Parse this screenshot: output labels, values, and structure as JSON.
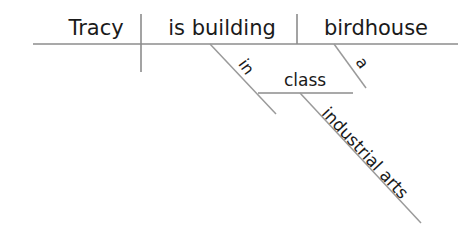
{
  "diagram": {
    "type": "reed-kellogg-sentence-diagram",
    "sentence": "Tracy is building a birdhouse in industrial arts class.",
    "line_color": "#8c8c8c",
    "text_color": "#1a1a1a",
    "background_color": "#ffffff",
    "words": {
      "subject": "Tracy",
      "verb": "is building",
      "direct_object": "birdhouse",
      "article": "a",
      "preposition": "in",
      "object_of_preposition": "class",
      "modifier": "industrial arts"
    },
    "labels": [
      {
        "id": "subject",
        "text": "Tracy",
        "role": "subject",
        "x": 96,
        "y": 35,
        "rotation": 0,
        "size": "large"
      },
      {
        "id": "verb",
        "text": "is building",
        "role": "verb",
        "x": 222,
        "y": 35,
        "rotation": 0,
        "size": "large"
      },
      {
        "id": "direct-object",
        "text": "birdhouse",
        "role": "direct-object",
        "x": 376,
        "y": 35,
        "rotation": 0,
        "size": "large"
      },
      {
        "id": "article-a",
        "text": "a",
        "role": "article-modifier",
        "x": 358,
        "y": 66,
        "rotation": 54,
        "size": "small"
      },
      {
        "id": "preposition-in",
        "text": "in",
        "role": "preposition",
        "x": 240,
        "y": 70,
        "rotation": 54,
        "size": "small"
      },
      {
        "id": "object-of-prep",
        "text": "class",
        "role": "object-of-preposition",
        "x": 305,
        "y": 85,
        "rotation": 0,
        "size": "medium"
      },
      {
        "id": "modifier-industrial-arts",
        "text": "industrial arts",
        "role": "compound-modifier",
        "x": 360,
        "y": 155,
        "rotation": 54,
        "size": "medium"
      }
    ],
    "lines": [
      {
        "id": "baseline",
        "kind": "horizontal-baseline",
        "x1": 33,
        "y1": 44,
        "x2": 458,
        "y2": 44
      },
      {
        "id": "subject-verb-divider",
        "kind": "vertical-full",
        "x1": 141,
        "y1": 14,
        "x2": 141,
        "y2": 72
      },
      {
        "id": "verb-object-divider",
        "kind": "vertical-half",
        "x1": 297,
        "y1": 14,
        "x2": 297,
        "y2": 44
      },
      {
        "id": "article-slant",
        "kind": "diagonal-modifier",
        "x1": 334,
        "y1": 44,
        "x2": 366,
        "y2": 88
      },
      {
        "id": "preposition-slant",
        "kind": "diagonal-preposition",
        "x1": 210,
        "y1": 44,
        "x2": 276,
        "y2": 114
      },
      {
        "id": "prep-object-line",
        "kind": "horizontal-branch",
        "x1": 258,
        "y1": 93,
        "x2": 353,
        "y2": 93
      },
      {
        "id": "modifier-slant",
        "kind": "diagonal-modifier",
        "x1": 300,
        "y1": 93,
        "x2": 421,
        "y2": 223
      }
    ]
  }
}
